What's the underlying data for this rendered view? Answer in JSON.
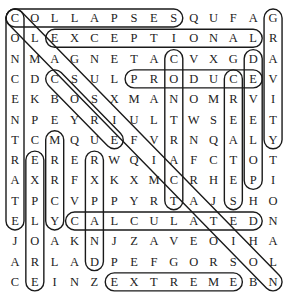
{
  "puzzle": {
    "rows": [
      "COLLAPSESQUFAG",
      "OLEXCEPTIONALR",
      "NMAGNETACVXGDA",
      "CDCSULPRODUCEV",
      "EKBOSXMANOMRVI",
      "NPEYRIULTWSEET",
      "TCMQUEFVRNQALY",
      "RERERWQIAFCTOT",
      "AXRFXKXMCRHEPI",
      "TPCVPPYRTAJSHO",
      "ELYCALCULATEDN",
      "JOAKNJZAVEOIHA",
      "ARLADPEFGORSOL",
      "CEINZEXTREMEBN"
    ],
    "found_words": [
      {
        "word": "COLLAPSES",
        "start": [
          0,
          0
        ],
        "end": [
          0,
          8
        ]
      },
      {
        "word": "EXCEPTIONAL",
        "start": [
          1,
          2
        ],
        "end": [
          1,
          12
        ]
      },
      {
        "word": "PRODUCE",
        "start": [
          3,
          6
        ],
        "end": [
          3,
          12
        ]
      },
      {
        "word": "CALCULATED",
        "start": [
          10,
          3
        ],
        "end": [
          10,
          12
        ]
      },
      {
        "word": "EXTREME",
        "start": [
          13,
          5
        ],
        "end": [
          13,
          11
        ]
      },
      {
        "word": "GRAVITY",
        "start": [
          0,
          13
        ],
        "end": [
          6,
          13
        ]
      },
      {
        "word": "CONCENTRATE",
        "start": [
          0,
          0
        ],
        "end": [
          10,
          0
        ]
      },
      {
        "word": "CONTRACT",
        "start": [
          2,
          8
        ],
        "end": [
          9,
          8
        ]
      },
      {
        "word": "DEVELOP",
        "start": [
          2,
          12
        ],
        "end": [
          8,
          12
        ]
      },
      {
        "word": "CREATES",
        "start": [
          3,
          11
        ],
        "end": [
          9,
          11
        ]
      },
      {
        "word": "EXPLORE",
        "start": [
          7,
          1
        ],
        "end": [
          13,
          1
        ]
      },
      {
        "word": "MERCY",
        "start": [
          6,
          2
        ],
        "end": [
          10,
          2
        ]
      },
      {
        "word": "EXPAND",
        "start": [
          7,
          4
        ],
        "end": [
          12,
          4
        ]
      },
      {
        "word": "CORE",
        "start": [
          3,
          2
        ],
        "end": [
          6,
          5
        ]
      },
      {
        "word": "CLASSIFICATION",
        "start": [
          0,
          0
        ],
        "end": [
          13,
          13
        ]
      }
    ]
  }
}
